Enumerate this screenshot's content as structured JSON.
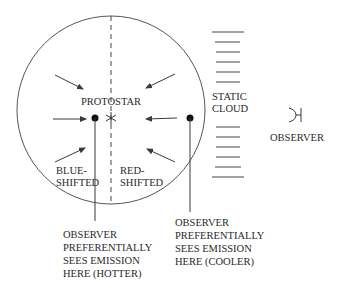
{
  "labels": {
    "protostar": "PROTOSTAR",
    "static_cloud": [
      "STATIC",
      "CLOUD"
    ],
    "observer": "OBSERVER",
    "blue_shifted": [
      "BLUE-",
      "SHIFTED"
    ],
    "red_shifted": [
      "RED-",
      "SHIFTED"
    ],
    "hotter_note": [
      "OBSERVER",
      "PREFERENTIALLY",
      "SEES EMISSION",
      "HERE (HOTTER)"
    ],
    "cooler_note": [
      "OBSERVER",
      "PREFERENTIALLY",
      "SEES EMISSION",
      "HERE (COOLER)"
    ]
  },
  "colors": {
    "stroke": "#3a3a3a",
    "text": "#2a2a2a",
    "background": "#ffffff"
  }
}
